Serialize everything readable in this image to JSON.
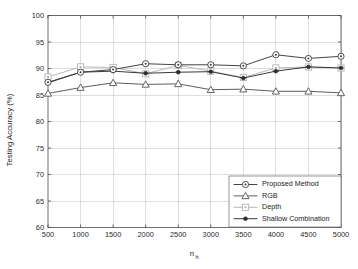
{
  "chart_data": {
    "type": "line",
    "title": "",
    "xlabel": "n_h",
    "xlabel_base": "n",
    "xlabel_sub": "h",
    "ylabel": "Testing Accuracy (%)",
    "x": [
      500,
      1000,
      1500,
      2000,
      2500,
      3000,
      3500,
      4000,
      4500,
      5000
    ],
    "xticklabels": [
      "500",
      "1000",
      "1500",
      "2000",
      "2500",
      "3000",
      "3500",
      "4000",
      "4500",
      "5000"
    ],
    "yticklabels": [
      "60",
      "65",
      "70",
      "75",
      "80",
      "85",
      "90",
      "95",
      "100"
    ],
    "yticks": [
      60,
      65,
      70,
      75,
      80,
      85,
      90,
      95,
      100
    ],
    "xlim": [
      500,
      5000
    ],
    "ylim": [
      60,
      100
    ],
    "grid": true,
    "legend_position": "lower right",
    "series": [
      {
        "name": "Proposed Method",
        "marker": "circle",
        "color": "#3a3a3a",
        "values": [
          87.4,
          89.3,
          89.8,
          90.9,
          90.7,
          90.7,
          90.5,
          92.6,
          91.9,
          92.3
        ]
      },
      {
        "name": "RGB",
        "marker": "triangle",
        "color": "#555555",
        "values": [
          85.3,
          86.4,
          87.3,
          87.0,
          87.1,
          86.0,
          86.1,
          85.7,
          85.7,
          85.4
        ]
      },
      {
        "name": "Depth",
        "marker": "square",
        "color": "#b4b4b4",
        "values": [
          88.4,
          90.3,
          90.2,
          89.0,
          90.6,
          89.5,
          88.3,
          90.1,
          90.3,
          90.1
        ]
      },
      {
        "name": "Shallow Combination",
        "marker": "dot",
        "color": "#2e2e2e",
        "values": [
          87.3,
          89.3,
          89.5,
          89.1,
          89.3,
          89.4,
          88.2,
          89.5,
          90.3,
          90.1
        ]
      }
    ]
  },
  "legend": {
    "items": [
      {
        "label": "Proposed Method"
      },
      {
        "label": "RGB"
      },
      {
        "label": "Depth"
      },
      {
        "label": "Shallow Combination"
      }
    ]
  },
  "axes": {
    "y_title": "Testing Accuracy (%)",
    "x_title_base": "n",
    "x_title_sub": "h"
  }
}
